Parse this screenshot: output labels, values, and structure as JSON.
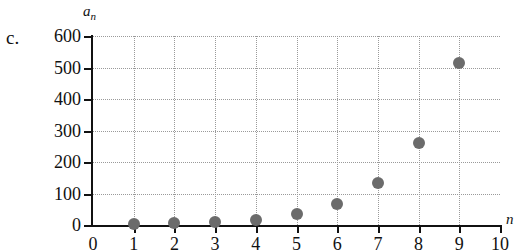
{
  "part_label": "c.",
  "axis_name_y_base": "a",
  "axis_name_y_sub": "n",
  "axis_name_x": "n",
  "chart_data": {
    "type": "scatter",
    "title": "",
    "xlabel": "n",
    "ylabel": "a_n",
    "xlim": [
      0,
      10
    ],
    "ylim": [
      0,
      600
    ],
    "grid": true,
    "legend": "none",
    "marker_color": "#6b6b6b",
    "axis_color": "#111111",
    "grid_color": "#9a9a9a",
    "x_ticks": [
      0,
      1,
      2,
      3,
      4,
      5,
      6,
      7,
      8,
      9,
      10
    ],
    "x_tick_labels": [
      "0",
      "1",
      "2",
      "3",
      "4",
      "5",
      "6",
      "7",
      "8",
      "9",
      "10"
    ],
    "y_ticks": [
      0,
      100,
      200,
      300,
      400,
      500,
      600
    ],
    "y_tick_labels": [
      "0",
      "100",
      "200",
      "300",
      "400",
      "500",
      "600"
    ],
    "x": [
      1,
      2,
      3,
      4,
      5,
      6,
      7,
      8,
      9
    ],
    "values": [
      2,
      5,
      10,
      17,
      35,
      67,
      133,
      260,
      515
    ],
    "points": [
      {
        "n": 1,
        "a": 2
      },
      {
        "n": 2,
        "a": 5
      },
      {
        "n": 3,
        "a": 10
      },
      {
        "n": 4,
        "a": 17
      },
      {
        "n": 5,
        "a": 35
      },
      {
        "n": 6,
        "a": 67
      },
      {
        "n": 7,
        "a": 133
      },
      {
        "n": 8,
        "a": 260
      },
      {
        "n": 9,
        "a": 515
      }
    ]
  }
}
